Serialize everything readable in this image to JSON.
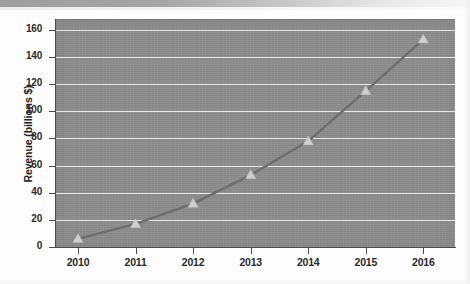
{
  "chart_data": {
    "type": "line",
    "title": "",
    "subtitle": "",
    "xlabel": "",
    "ylabel": "Revenue (billions $)",
    "categories": [
      "2010",
      "2011",
      "2012",
      "2013",
      "2014",
      "2015",
      "2016"
    ],
    "x": [
      2010,
      2011,
      2012,
      2013,
      2014,
      2015,
      2016
    ],
    "values": [
      6,
      17,
      32,
      53,
      78,
      115,
      153
    ],
    "series": [
      {
        "name": "Revenue",
        "values": [
          6,
          17,
          32,
          53,
          78,
          115,
          153
        ],
        "marker": "triangle",
        "line_color": "#6d6d6d",
        "marker_color": "#cfcfcf"
      }
    ],
    "ylim": [
      0,
      168
    ],
    "xlim": [
      2009.6,
      2016.55
    ],
    "yticks": [
      0,
      20,
      40,
      60,
      80,
      100,
      120,
      140,
      160
    ],
    "ytick_labels": [
      "0",
      "20",
      "40",
      "60",
      "80",
      "100",
      "120",
      "140",
      "160"
    ],
    "xtick_labels": [
      "2010",
      "2011",
      "2012",
      "2013",
      "2014",
      "2015",
      "2016"
    ],
    "grid": "horizontal",
    "grid_color": "#f0f0f0",
    "legend": "none",
    "legend_position": "none",
    "plot_background": "#8d8d8d",
    "figure_background": "#fdfdfd",
    "axis_color": "#4a4a4a",
    "tick_label_color": "#2b2b2b"
  },
  "figure": {
    "y_axis_title": "Revenue (billions $)",
    "appearance_note": "scanned-page"
  }
}
